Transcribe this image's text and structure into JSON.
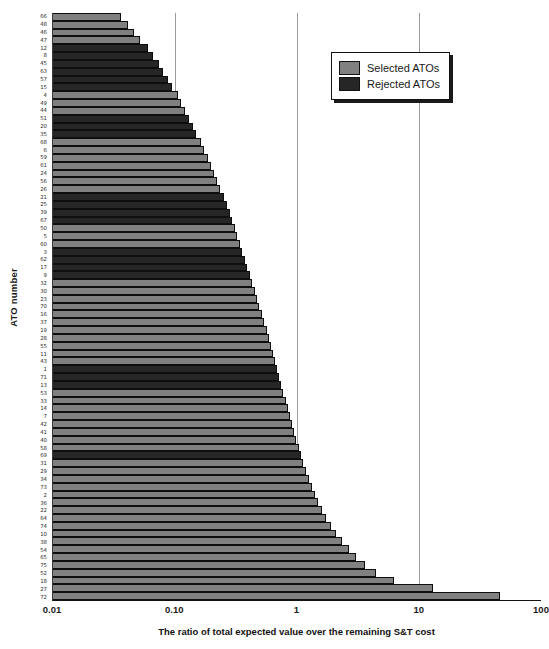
{
  "chart_data": {
    "type": "bar",
    "orientation": "horizontal",
    "title": "",
    "xlabel": "The ratio of total expected value over the remaining S&T cost",
    "ylabel": "ATO number",
    "xscale": "log",
    "xlim": [
      0.01,
      100
    ],
    "xticks": [
      "0.01",
      "0.10",
      "1",
      "10",
      "100"
    ],
    "xtick_values": [
      0.01,
      0.1,
      1,
      10,
      100
    ],
    "grid": "vertical gridlines at 0.10, 1, 10",
    "legend_position": "top-right",
    "legend": [
      {
        "label": "Selected ATOs",
        "color": "#808080",
        "key": "selected"
      },
      {
        "label": "Rejected ATOs",
        "color": "#262626",
        "key": "rejected"
      }
    ],
    "categories": [
      "66",
      "48",
      "46",
      "47",
      "12",
      "8",
      "45",
      "63",
      "57",
      "15",
      "4",
      "49",
      "44",
      "51",
      "20",
      "35",
      "68",
      "6",
      "59",
      "61",
      "24",
      "56",
      "26",
      "21",
      "25",
      "39",
      "67",
      "50",
      "5",
      "60",
      "3",
      "62",
      "17",
      "9",
      "32",
      "30",
      "23",
      "70",
      "16",
      "37",
      "19",
      "28",
      "55",
      "11",
      "43",
      "1",
      "71",
      "13",
      "53",
      "33",
      "14",
      "7",
      "42",
      "41",
      "40",
      "58",
      "69",
      "31",
      "29",
      "34",
      "73",
      "2",
      "36",
      "22",
      "64",
      "74",
      "10",
      "38",
      "54",
      "65",
      "75",
      "52",
      "18",
      "27",
      "72"
    ],
    "values": [
      0.036,
      0.041,
      0.046,
      0.052,
      0.06,
      0.066,
      0.074,
      0.08,
      0.088,
      0.095,
      0.105,
      0.112,
      0.121,
      0.13,
      0.14,
      0.15,
      0.162,
      0.174,
      0.186,
      0.198,
      0.21,
      0.222,
      0.236,
      0.25,
      0.265,
      0.28,
      0.295,
      0.31,
      0.325,
      0.34,
      0.357,
      0.374,
      0.392,
      0.41,
      0.43,
      0.45,
      0.47,
      0.492,
      0.515,
      0.54,
      0.565,
      0.59,
      0.615,
      0.64,
      0.665,
      0.69,
      0.715,
      0.745,
      0.775,
      0.805,
      0.84,
      0.875,
      0.91,
      0.95,
      0.99,
      1.03,
      1.08,
      1.13,
      1.19,
      1.25,
      1.32,
      1.4,
      1.49,
      1.6,
      1.73,
      1.9,
      2.1,
      2.35,
      2.65,
      3.05,
      3.6,
      4.4,
      6.2,
      13.0,
      46.0
    ],
    "series": [
      {
        "name": "Selected ATOs",
        "color": "#808080"
      },
      {
        "name": "Rejected ATOs",
        "color": "#262626"
      }
    ],
    "bar_types": [
      "selected",
      "selected",
      "selected",
      "selected",
      "rejected",
      "rejected",
      "rejected",
      "rejected",
      "rejected",
      "rejected",
      "selected",
      "selected",
      "selected",
      "rejected",
      "rejected",
      "rejected",
      "selected",
      "selected",
      "selected",
      "selected",
      "selected",
      "selected",
      "selected",
      "rejected",
      "rejected",
      "rejected",
      "rejected",
      "selected",
      "selected",
      "selected",
      "rejected",
      "rejected",
      "rejected",
      "rejected",
      "selected",
      "selected",
      "selected",
      "selected",
      "selected",
      "selected",
      "selected",
      "selected",
      "selected",
      "selected",
      "selected",
      "rejected",
      "rejected",
      "rejected",
      "selected",
      "selected",
      "selected",
      "selected",
      "selected",
      "selected",
      "selected",
      "selected",
      "rejected",
      "selected",
      "selected",
      "selected",
      "selected",
      "selected",
      "selected",
      "selected",
      "selected",
      "selected",
      "selected",
      "selected",
      "selected",
      "selected",
      "selected",
      "selected",
      "selected",
      "selected",
      "selected"
    ],
    "n_bars": 75
  }
}
